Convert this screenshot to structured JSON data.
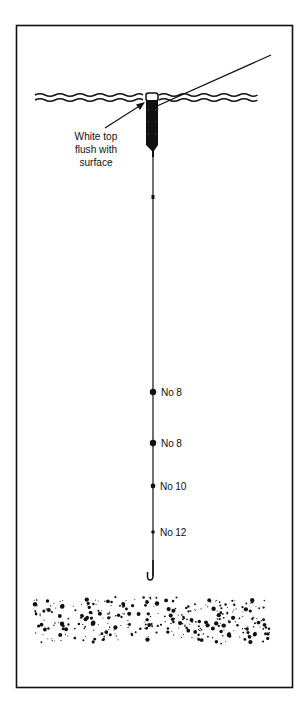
{
  "diagram": {
    "type": "float-fishing-rig",
    "colors": {
      "ink": "#111111",
      "background": "#ffffff"
    },
    "callout": {
      "lines": [
        "White top",
        "flush with",
        "surface"
      ]
    },
    "shots": [
      {
        "label": "No 8",
        "y": 392,
        "r": 3.2
      },
      {
        "label": "No 8",
        "y": 443,
        "r": 3.2
      },
      {
        "label": "No 10",
        "y": 486,
        "r": 2.4
      },
      {
        "label": "No 12",
        "y": 532,
        "r": 1.8
      }
    ],
    "elements": {
      "frame": "border",
      "surface": "water-surface-waves",
      "float": "float-with-white-tip",
      "line_above": "line-to-rod",
      "main_line": "main-line",
      "hook": "hook",
      "bed": "gravel-bed"
    }
  }
}
